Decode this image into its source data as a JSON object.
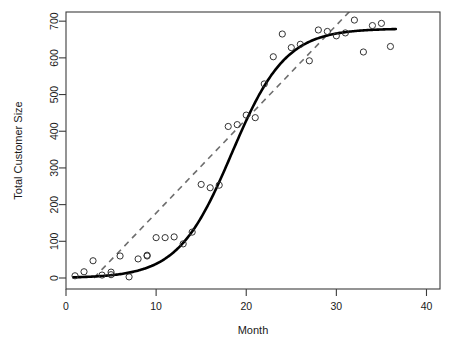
{
  "chart_data": {
    "type": "scatter",
    "title": "",
    "xlabel": "Month",
    "ylabel": "Total Customer Size",
    "xlim": [
      0,
      41.5
    ],
    "ylim": [
      -30,
      725
    ],
    "xticks": [
      0,
      10,
      20,
      30,
      40
    ],
    "yticks": [
      0,
      100,
      200,
      300,
      400,
      500,
      600,
      700
    ],
    "xtick_labels": [
      "0",
      "10",
      "20",
      "30",
      "40"
    ],
    "ytick_labels": [
      "0",
      "100",
      "200",
      "300",
      "400",
      "500",
      "600",
      "700"
    ],
    "grid": false,
    "legend": "none",
    "box": true,
    "series": [
      {
        "name": "Observed customer size",
        "type": "scatter",
        "marker": "open-circle",
        "color": "#333333",
        "x": [
          1,
          2,
          3,
          4,
          5,
          5,
          6,
          7,
          8,
          9,
          9,
          10,
          11,
          12,
          13,
          14,
          15,
          16,
          17,
          18,
          19,
          20,
          21,
          22,
          23,
          24,
          25,
          26,
          27,
          28,
          29,
          30,
          31,
          32,
          33,
          34,
          35,
          36
        ],
        "y": [
          6,
          17,
          47,
          8,
          9,
          16,
          60,
          3,
          52,
          60,
          62,
          110,
          110,
          112,
          93,
          125,
          255,
          246,
          253,
          413,
          418,
          444,
          437,
          529,
          603,
          665,
          628,
          637,
          592,
          676,
          672,
          660,
          668,
          703,
          616,
          688,
          694,
          631
        ]
      },
      {
        "name": "Logistic fit",
        "type": "line",
        "style": "solid",
        "color": "#000000",
        "width": 2.6,
        "model": "logistic",
        "asymptote": 680,
        "midpoint": 18.4,
        "rate": 0.335,
        "x_range": [
          0.8,
          36.6
        ]
      },
      {
        "name": "Linear trend",
        "type": "line",
        "style": "dashed",
        "color": "#6e6e6e",
        "width": 1.6,
        "slope": 25.6,
        "intercept": -79,
        "x_range": [
          3.1,
          31.5
        ]
      }
    ]
  }
}
